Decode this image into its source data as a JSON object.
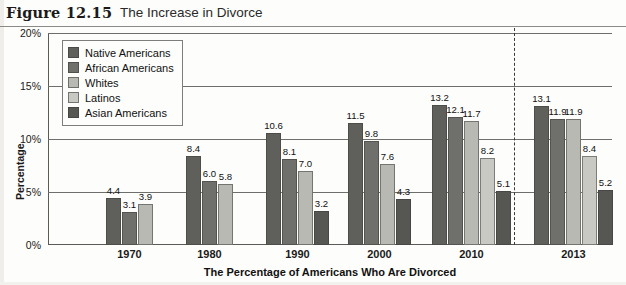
{
  "figure": {
    "label": "Figure 12.15",
    "title": "The Increase in Divorce"
  },
  "chart_data": {
    "type": "bar",
    "title": "The Increase in Divorce",
    "xlabel": "The Percentage of Americans Who Are Divorced",
    "ylabel": "Percentage",
    "categories": [
      "1970",
      "1980",
      "1990",
      "2000",
      "2010",
      "2013"
    ],
    "ylim": [
      0,
      20
    ],
    "ytick_labels": [
      "0%",
      "5%",
      "10%",
      "15%",
      "20%"
    ],
    "ytick_values": [
      0,
      5,
      10,
      15,
      20
    ],
    "grid": true,
    "legend_position": "upper-left-inside",
    "series": [
      {
        "name": "Native Americans",
        "color": "#5f5f5c",
        "values": [
          4.4,
          8.4,
          10.6,
          11.5,
          13.2,
          13.1
        ],
        "labels": [
          "4.4",
          "8.4",
          "10.6",
          "11.5",
          "13.2",
          "13.1"
        ]
      },
      {
        "name": "African Americans",
        "color": "#6f6f6c",
        "values": [
          3.1,
          6.0,
          8.1,
          9.8,
          12.1,
          11.9
        ],
        "labels": [
          "3.1",
          "6.0",
          "8.1",
          "9.8",
          "12.1",
          "11.9"
        ]
      },
      {
        "name": "Whites",
        "color": "#b9b9b3",
        "values": [
          3.9,
          5.8,
          7.0,
          7.6,
          11.7,
          11.9
        ],
        "labels": [
          "3.9",
          "5.8",
          "7.0",
          "7.6",
          "11.7",
          "11.9"
        ]
      },
      {
        "name": "Latinos",
        "color": "#c9c9c3",
        "values": [
          null,
          null,
          null,
          null,
          8.2,
          8.4
        ],
        "labels": [
          "",
          "",
          "",
          "",
          "8.2",
          "8.4"
        ]
      },
      {
        "name": "Asian Americans",
        "color": "#565653",
        "values": [
          null,
          null,
          3.2,
          4.3,
          5.1,
          5.2
        ],
        "labels": [
          "",
          "",
          "3.2",
          "4.3",
          "5.1",
          "5.2"
        ]
      }
    ],
    "annotations": [
      {
        "type": "dashed-vertical-line",
        "between": [
          "2010",
          "2013"
        ]
      }
    ]
  }
}
